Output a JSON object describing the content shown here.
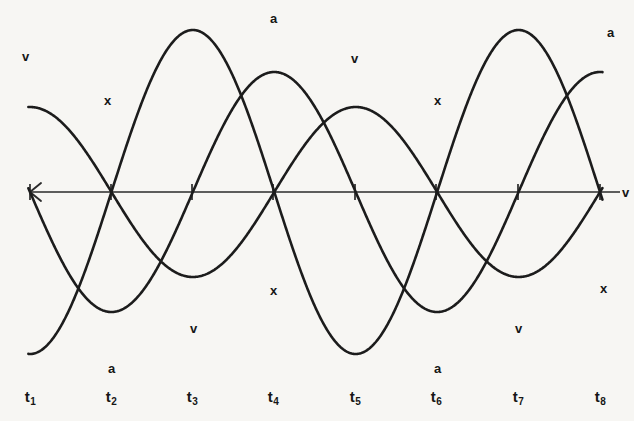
{
  "figure": {
    "background_color": "#f7f6f3",
    "ink_color": "#1c1c1c"
  },
  "chart_data": {
    "type": "line",
    "title": "",
    "xlabel": "",
    "ylabel": "",
    "grid": false,
    "legend_position": "inline-curve-labels",
    "x_tick_labels": [
      "t1",
      "t2",
      "t3",
      "t4",
      "t5",
      "t6",
      "t7",
      "t8"
    ],
    "x_tick_display": [
      "t₁",
      "t₂",
      "t₃",
      "t₄",
      "t₅",
      "t₆",
      "t₇",
      "t₈"
    ],
    "x_tick_positions_px": [
      30,
      111,
      192,
      273,
      355,
      436,
      518,
      600
    ],
    "axis_y_px": 192,
    "axis_x_start_px": 30,
    "axis_x_end_px": 620,
    "xlim": [
      0.5,
      8.3
    ],
    "ylim": [
      -1.05,
      1.05
    ],
    "series": [
      {
        "name": "x",
        "label": "x",
        "description": "displacement",
        "form": "sine",
        "amplitude_px": 85,
        "phase_quarter_periods": 1,
        "key_points": [
          {
            "t": "t1",
            "value": 0
          },
          {
            "t": "t2",
            "value": 1
          },
          {
            "t": "t3",
            "value": 0
          },
          {
            "t": "t4",
            "value": -1
          },
          {
            "t": "t5",
            "value": 0
          },
          {
            "t": "t6",
            "value": 1
          },
          {
            "t": "t7",
            "value": 0
          },
          {
            "t": "t8",
            "value": -1
          }
        ]
      },
      {
        "name": "v",
        "label": "v",
        "description": "velocity",
        "form": "cosine",
        "amplitude_px": 120,
        "phase_quarter_periods": 2,
        "key_points": [
          {
            "t": "t1",
            "value": 1
          },
          {
            "t": "t2",
            "value": 0
          },
          {
            "t": "t3",
            "value": -1
          },
          {
            "t": "t4",
            "value": 0
          },
          {
            "t": "t5",
            "value": 1
          },
          {
            "t": "t6",
            "value": 0
          },
          {
            "t": "t7",
            "value": -1
          },
          {
            "t": "t8",
            "value": 0
          }
        ]
      },
      {
        "name": "a",
        "label": "a",
        "description": "acceleration",
        "form": "negative sine",
        "amplitude_px": 162,
        "phase_quarter_periods": 3,
        "key_points": [
          {
            "t": "t1",
            "value": 0
          },
          {
            "t": "t2",
            "value": -1
          },
          {
            "t": "t3",
            "value": 0
          },
          {
            "t": "t4",
            "value": 1
          },
          {
            "t": "t5",
            "value": 0
          },
          {
            "t": "t6",
            "value": -1
          },
          {
            "t": "t7",
            "value": 0
          },
          {
            "t": "t8",
            "value": 1
          }
        ]
      }
    ],
    "curve_annotations": [
      {
        "label": "v",
        "x_px": 22,
        "y_px": 50,
        "series": "v",
        "note": "start of velocity curve, upper left"
      },
      {
        "label": "x",
        "x_px": 104,
        "y_px": 94,
        "series": "x",
        "note": "first displacement crest"
      },
      {
        "label": "a",
        "x_px": 270,
        "y_px": 12,
        "series": "a",
        "note": "acceleration crest"
      },
      {
        "label": "v",
        "x_px": 351,
        "y_px": 52,
        "series": "v",
        "note": "velocity crest"
      },
      {
        "label": "x",
        "x_px": 434,
        "y_px": 94,
        "series": "x",
        "note": "second displacement crest"
      },
      {
        "label": "a",
        "x_px": 607,
        "y_px": 26,
        "series": "a",
        "note": "end of acceleration curve, upper right"
      },
      {
        "label": "a",
        "x_px": 108,
        "y_px": 362,
        "series": "a",
        "note": "first acceleration trough"
      },
      {
        "label": "v",
        "x_px": 190,
        "y_px": 322,
        "series": "v",
        "note": "first velocity trough"
      },
      {
        "label": "x",
        "x_px": 270,
        "y_px": 284,
        "series": "x",
        "note": "first displacement trough"
      },
      {
        "label": "a",
        "x_px": 434,
        "y_px": 362,
        "series": "a",
        "note": "second acceleration trough"
      },
      {
        "label": "v",
        "x_px": 515,
        "y_px": 322,
        "series": "v",
        "note": "second velocity trough"
      },
      {
        "label": "x",
        "x_px": 600,
        "y_px": 282,
        "series": "x",
        "note": "end of displacement curve"
      },
      {
        "label": "v",
        "x_px": 622,
        "y_px": 186,
        "series": "v",
        "note": "end of velocity curve at axis"
      }
    ]
  }
}
